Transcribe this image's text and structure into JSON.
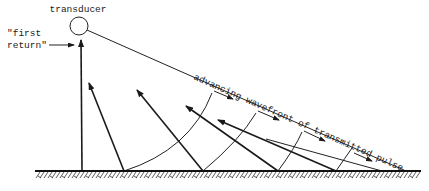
{
  "diagram": {
    "labels": {
      "transducer": "transducer",
      "first_return_line1": "\"first",
      "first_return_line2": "return\"",
      "wavefront": "advancing wavefront of transmitted pulse"
    },
    "colors": {
      "line": "#222222",
      "background": "#ffffff"
    },
    "elements": [
      "transducer-circle",
      "beam-edge-line",
      "ground-surface",
      "first-return-arrow",
      "backscatter-rays",
      "wavefront-arcs",
      "propagation-arrows"
    ]
  }
}
